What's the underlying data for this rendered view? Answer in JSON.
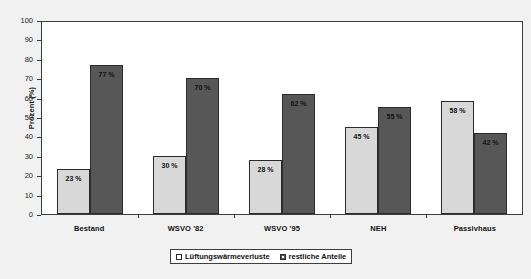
{
  "chart_data": {
    "type": "bar",
    "title": "",
    "xlabel": "",
    "ylabel": "Prozent (%)",
    "ylim": [
      0,
      100
    ],
    "yticks": [
      100,
      90,
      80,
      70,
      60,
      50,
      40,
      30,
      20,
      10,
      0
    ],
    "grid": false,
    "legend_position": "bottom",
    "categories": [
      "Bestand",
      "WSVO '82",
      "WSVO '95",
      "NEH",
      "Passivhaus"
    ],
    "series": [
      {
        "name": "Lüftungswärmeverluste",
        "color": "#d8d8d8",
        "values": [
          23,
          30,
          28,
          45,
          58
        ],
        "labels": [
          "23 %",
          "30 %",
          "28 %",
          "45 %",
          "58 %"
        ]
      },
      {
        "name": "restliche Anteile",
        "color": "#575757",
        "values": [
          77,
          70,
          62,
          55,
          42
        ],
        "labels": [
          "77 %",
          "70 %",
          "62 %",
          "55 %",
          "42 %"
        ]
      }
    ]
  },
  "axes": {
    "y_title": "Prozent (%)",
    "y_ticks": [
      "100",
      "90",
      "80",
      "70",
      "60",
      "50",
      "40",
      "30",
      "20",
      "10",
      "0"
    ],
    "x_categories": [
      "Bestand",
      "WSVO '82",
      "WSVO '95",
      "NEH",
      "Passivhaus"
    ]
  },
  "legend": {
    "entries": [
      {
        "label": "Lüftungswärmeverluste",
        "swatch": "light"
      },
      {
        "label": "restliche Anteile",
        "swatch": "dark"
      }
    ]
  },
  "bars": {
    "g0": {
      "light": "23 %",
      "dark": "77 %"
    },
    "g1": {
      "light": "30 %",
      "dark": "70 %"
    },
    "g2": {
      "light": "28 %",
      "dark": "62 %"
    },
    "g3": {
      "light": "45 %",
      "dark": "55 %"
    },
    "g4": {
      "light": "58 %",
      "dark": "42 %"
    }
  },
  "colors": {
    "series_light": "#d8d8d8",
    "series_dark": "#575757",
    "axis": "#3d3d3d",
    "canvas": "#f1f1f1",
    "plot_bg": "#ffffff"
  }
}
